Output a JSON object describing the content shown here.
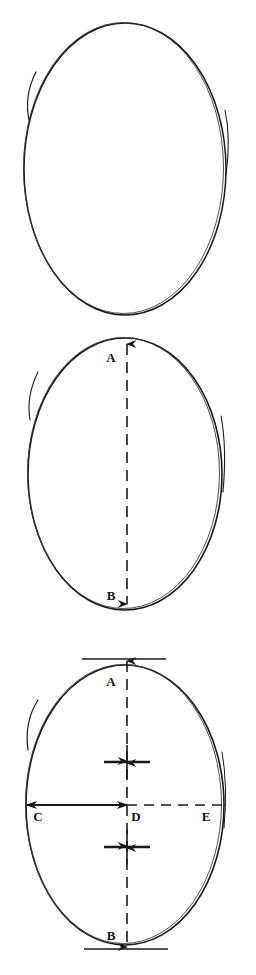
{
  "figure": {
    "background_color": "#ffffff",
    "ink_color": "#1a1a1a"
  },
  "panels": [
    {
      "id": "panel-1",
      "name": "plain-oval",
      "caption": "",
      "labels": []
    },
    {
      "id": "panel-2",
      "name": "oval-with-vertical-axis",
      "caption": "",
      "labels": [
        {
          "key": "a",
          "text": "A"
        },
        {
          "key": "b",
          "text": "B"
        }
      ]
    },
    {
      "id": "panel-3",
      "name": "oval-with-full-measurements",
      "caption": "",
      "labels": [
        {
          "key": "a",
          "text": "A"
        },
        {
          "key": "b",
          "text": "B"
        },
        {
          "key": "c",
          "text": "C"
        },
        {
          "key": "d",
          "text": "D"
        },
        {
          "key": "e",
          "text": "E"
        }
      ]
    }
  ],
  "labels": {
    "p2_a": "A",
    "p2_b": "B",
    "p3_a": "A",
    "p3_b": "B",
    "p3_c": "C",
    "p3_d": "D",
    "p3_e": "E"
  },
  "colors": {
    "ink": "#1a1a1a",
    "ink_soft": "#2b2b2b",
    "paper": "#ffffff"
  }
}
